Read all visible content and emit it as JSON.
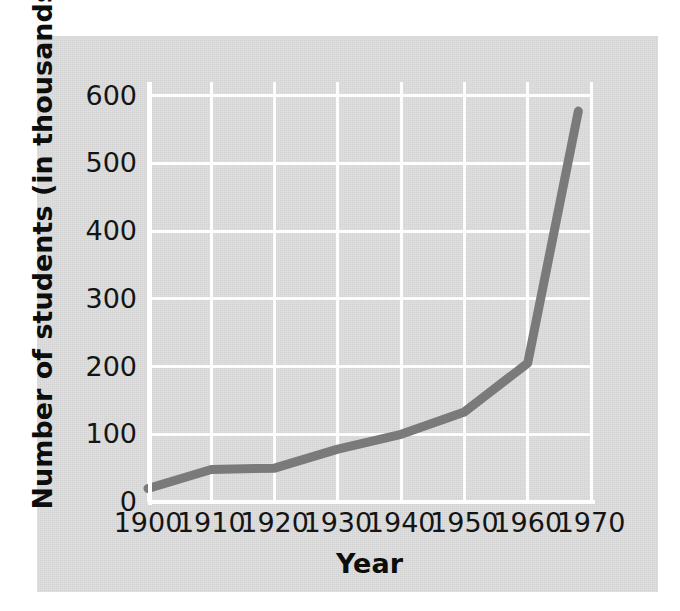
{
  "figure": {
    "background_color": "#ffffff",
    "panel_color": "#dcdcdc",
    "gridline_color": "#fdfdfd",
    "line_color": "#7a7a7a",
    "text_color": "#141414"
  },
  "chart_data": {
    "type": "line",
    "title": "",
    "xlabel": "Year",
    "ylabel": "Number of students (in thousands)",
    "x": [
      1900,
      1910,
      1920,
      1930,
      1940,
      1950,
      1960,
      1968
    ],
    "values": [
      20,
      48,
      50,
      78,
      100,
      133,
      205,
      577
    ],
    "series": [
      {
        "name": "Number of students",
        "x": [
          1900,
          1910,
          1920,
          1930,
          1940,
          1950,
          1960,
          1968
        ],
        "values": [
          20,
          48,
          50,
          78,
          100,
          133,
          205,
          577
        ]
      }
    ],
    "xlim": [
      1900,
      1970
    ],
    "ylim": [
      0,
      620
    ],
    "xticks": [
      1900,
      1910,
      1920,
      1930,
      1940,
      1950,
      1960,
      1970
    ],
    "xtick_labels": [
      "1900",
      "1910",
      "1920",
      "1930",
      "1940",
      "1950",
      "1960",
      "1970"
    ],
    "yticks": [
      0,
      100,
      200,
      300,
      400,
      500,
      600
    ],
    "ytick_labels": [
      "0",
      "100",
      "200",
      "300",
      "400",
      "500",
      "600"
    ],
    "grid": true,
    "legend": null,
    "annotations": []
  }
}
